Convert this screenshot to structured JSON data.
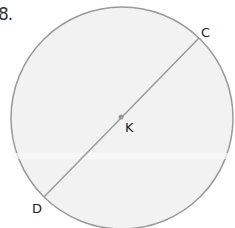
{
  "problem": {
    "number_label": "8."
  },
  "figure": {
    "circle": {
      "cx": 122,
      "cy": 118,
      "r": 111,
      "fill": "#f2f2f2",
      "stroke": "#9a9a9a"
    },
    "diameter": {
      "from": "C",
      "to": "D",
      "stroke": "#9a9a9a"
    },
    "points": [
      {
        "name": "C",
        "x": 199,
        "y": 38,
        "label_x": 201,
        "label_y": 37
      },
      {
        "name": "K",
        "x": 121,
        "y": 117,
        "label_x": 125,
        "label_y": 132
      },
      {
        "name": "D",
        "x": 44,
        "y": 197,
        "label_x": 32,
        "label_y": 213
      }
    ],
    "center_label": "K"
  }
}
